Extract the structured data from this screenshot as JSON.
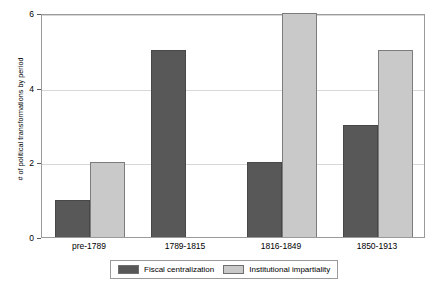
{
  "chart_data": {
    "type": "bar",
    "title": "",
    "subtitle": "",
    "xlabel": "",
    "ylabel": "# of political transformations by period",
    "categories": [
      "pre-1789",
      "1789-1815",
      "1816-1849",
      "1850-1913"
    ],
    "series": [
      {
        "name": "Fiscal centralization",
        "color": "#585858",
        "values": [
          1,
          5,
          2,
          3
        ]
      },
      {
        "name": "Institutional impartiality",
        "color": "#c9c9c9",
        "values": [
          2,
          0,
          6,
          5
        ]
      }
    ],
    "ylim": [
      0,
      6
    ],
    "yticks": [
      0,
      2,
      4,
      6
    ],
    "ytick_labels": [
      "0",
      "2",
      "4",
      "6"
    ],
    "grid": "horizontal",
    "legend_position": "bottom-center",
    "grouping": "grouped",
    "annotations": []
  },
  "axes": {
    "y_title": "# of political transformations by period",
    "y_tick_labels": [
      "6",
      "4",
      "2",
      "0"
    ],
    "x_tick_labels": [
      "pre-1789",
      "1789-1815",
      "1816-1849",
      "1850-1913"
    ]
  },
  "legend": {
    "entries": [
      {
        "label": "Fiscal centralization",
        "color": "#585858"
      },
      {
        "label": "Institutional impartiality",
        "color": "#c9c9c9"
      }
    ]
  },
  "style": {
    "grid_color": "#d7d7d7",
    "frame_color": "#9a9a9a",
    "background": "#ffffff"
  }
}
